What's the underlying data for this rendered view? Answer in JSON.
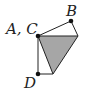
{
  "diagram": {
    "labels": {
      "ac": "A, C",
      "b": "B",
      "d": "D"
    },
    "colors": {
      "fill": "#a6a6a6",
      "stroke": "#222222",
      "background": "#ffffff"
    },
    "points": {
      "AC": [
        38,
        36
      ],
      "B": [
        71,
        21
      ],
      "R": [
        78,
        36
      ],
      "D": [
        38,
        74
      ],
      "E": [
        53,
        74
      ]
    }
  }
}
